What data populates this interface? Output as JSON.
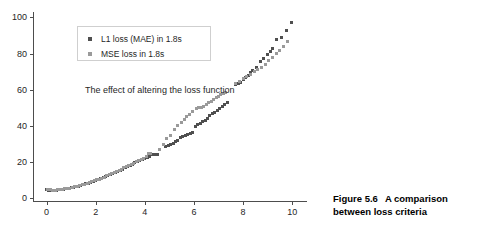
{
  "figure": {
    "caption_label": "Figure 5.6",
    "caption_text": "A comparison between loss criteria"
  },
  "annotation": {
    "text": "The effect of altering the loss function"
  },
  "legend": {
    "entries": [
      {
        "label": "L1 loss (MAE) in 1.8s",
        "color": "#4f4f4f",
        "marker": "square-marker"
      },
      {
        "label": "MSE loss in 1.8s",
        "color": "#9a9a9a",
        "marker": "square-marker"
      }
    ]
  },
  "chart_data": {
    "type": "scatter",
    "title": "",
    "subtitle": "",
    "annotation": "The effect of altering the loss function",
    "xlabel": "",
    "ylabel": "",
    "xlim": [
      -0.55,
      10.6
    ],
    "ylim": [
      -2.0,
      103.0
    ],
    "xticks": [
      0,
      2,
      4,
      6,
      8,
      10
    ],
    "yticks": [
      0,
      20,
      40,
      60,
      80,
      100
    ],
    "grid": false,
    "legend_position": "upper left",
    "marker": "square",
    "marker_size": 3,
    "series": [
      {
        "name": "L1 loss (MAE) in 1.8s",
        "color": "#4f4f4f",
        "x": [
          0.0,
          0.1,
          0.2,
          0.3,
          0.4,
          0.5,
          0.6,
          0.7,
          0.8,
          0.9,
          1.0,
          1.1,
          1.2,
          1.3,
          1.4,
          1.5,
          1.6,
          1.7,
          1.8,
          1.9,
          2.0,
          2.1,
          2.2,
          2.3,
          2.4,
          2.5,
          2.6,
          2.7,
          2.8,
          2.9,
          3.0,
          3.1,
          3.2,
          3.3,
          3.4,
          3.5,
          3.6,
          3.7,
          3.8,
          3.9,
          4.0,
          4.1,
          4.2,
          4.3,
          4.4,
          4.5,
          4.85,
          4.95,
          5.05,
          5.15,
          5.25,
          5.35,
          5.45,
          5.55,
          5.65,
          5.75,
          5.85,
          5.95,
          6.05,
          6.15,
          6.25,
          6.35,
          6.45,
          6.55,
          6.65,
          6.75,
          6.85,
          6.95,
          7.05,
          7.15,
          7.25,
          7.35,
          7.7,
          7.8,
          7.9,
          8.0,
          8.1,
          8.2,
          8.3,
          8.4,
          8.55,
          8.7,
          8.85,
          9.0,
          9.1,
          9.2,
          9.35,
          9.55,
          9.75,
          9.95
        ],
        "y": [
          4.8,
          4.6,
          4.5,
          4.5,
          4.6,
          4.7,
          4.8,
          5.0,
          5.2,
          5.5,
          5.8,
          6.1,
          6.4,
          6.8,
          7.2,
          7.6,
          8.0,
          8.5,
          9.0,
          9.4,
          9.9,
          10.4,
          10.9,
          11.4,
          11.9,
          12.5,
          13.1,
          13.7,
          14.3,
          14.9,
          15.5,
          16.2,
          16.9,
          17.6,
          18.3,
          19.0,
          19.7,
          20.4,
          21.0,
          21.6,
          22.2,
          22.8,
          23.4,
          24.3,
          24.4,
          24.4,
          28.6,
          29.2,
          29.9,
          30.6,
          31.3,
          32.0,
          33.6,
          34.2,
          34.8,
          35.5,
          36.1,
          36.3,
          39.8,
          40.6,
          41.4,
          42.3,
          43.2,
          44.0,
          45.9,
          46.8,
          47.7,
          48.7,
          49.7,
          50.8,
          51.9,
          53.1,
          63.0,
          63.6,
          64.3,
          65.5,
          66.8,
          68.0,
          69.3,
          70.5,
          72.2,
          75.5,
          77.2,
          79.5,
          81.3,
          83.1,
          88.0,
          89.0,
          92.9,
          97.2
        ]
      },
      {
        "name": "MSE loss in 1.8s",
        "color": "#9a9a9a",
        "x": [
          0.05,
          0.15,
          0.25,
          0.35,
          0.45,
          0.55,
          0.65,
          0.75,
          0.85,
          0.95,
          1.05,
          1.15,
          1.25,
          1.35,
          1.45,
          1.55,
          1.65,
          1.75,
          1.85,
          1.95,
          2.05,
          2.15,
          2.25,
          2.35,
          2.45,
          2.55,
          2.65,
          2.75,
          2.85,
          2.95,
          3.05,
          3.15,
          3.25,
          3.35,
          3.45,
          3.55,
          3.65,
          3.75,
          3.85,
          3.95,
          4.05,
          4.15,
          4.25,
          4.6,
          4.75,
          4.9,
          5.05,
          5.2,
          5.35,
          5.5,
          5.6,
          5.7,
          5.8,
          5.95,
          6.1,
          6.2,
          6.3,
          6.4,
          6.5,
          6.6,
          6.7,
          6.8,
          6.9,
          7.0,
          7.1,
          7.2,
          7.3,
          7.7,
          7.85,
          8.0,
          8.15,
          8.3,
          8.45,
          8.6,
          8.75,
          8.9,
          9.05,
          9.2,
          9.35,
          9.5,
          9.65,
          9.8
        ],
        "y": [
          4.9,
          4.7,
          4.6,
          4.6,
          4.7,
          4.8,
          5.0,
          5.2,
          5.4,
          5.7,
          6.0,
          6.3,
          6.7,
          7.0,
          7.4,
          7.8,
          8.3,
          8.8,
          9.2,
          9.7,
          10.2,
          10.7,
          11.2,
          11.8,
          12.4,
          13.0,
          13.6,
          14.2,
          14.8,
          15.4,
          16.1,
          16.8,
          17.4,
          18.1,
          18.8,
          19.5,
          20.2,
          20.9,
          21.6,
          22.3,
          23.0,
          24.8,
          24.9,
          27.2,
          30.0,
          33.3,
          35.0,
          38.3,
          40.5,
          42.0,
          43.5,
          45.0,
          46.2,
          47.8,
          49.5,
          50.0,
          50.2,
          51.0,
          52.0,
          52.9,
          53.8,
          54.7,
          55.6,
          56.5,
          57.4,
          58.2,
          58.6,
          63.3,
          64.6,
          66.0,
          67.3,
          68.6,
          70.0,
          71.2,
          72.6,
          74.0,
          76.0,
          78.0,
          80.0,
          82.0,
          84.0,
          86.8
        ]
      }
    ]
  }
}
